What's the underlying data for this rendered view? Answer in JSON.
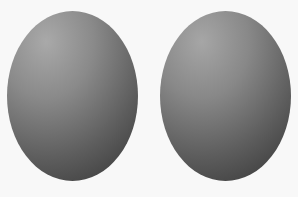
{
  "scene": {
    "background_color": "#f8f8f8",
    "shapes": [
      {
        "id": "left",
        "type": "ellipse",
        "description": "gray shaded oval, lighter top-left, darker bottom-right",
        "bounds": {
          "x": 7,
          "y": 11,
          "width": 131,
          "height": 170
        },
        "highlight_color": "#a9a9a9",
        "shadow_color": "#303030"
      },
      {
        "id": "right",
        "type": "ellipse",
        "description": "gray shaded oval, lighter top-left, darker bottom-right",
        "bounds": {
          "x": 160,
          "y": 11,
          "width": 131,
          "height": 170
        },
        "highlight_color": "#a6a6a6",
        "shadow_color": "#2e2e2e"
      }
    ]
  }
}
